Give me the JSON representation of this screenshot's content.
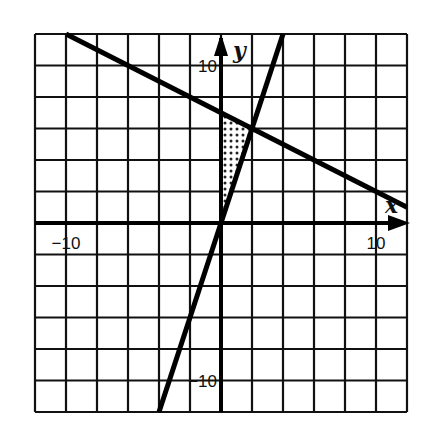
{
  "chart_data": {
    "type": "line",
    "title": "",
    "xlabel": "x",
    "ylabel": "y",
    "xlim": [
      -12,
      12
    ],
    "ylim": [
      -12,
      12
    ],
    "grid": true,
    "grid_step": 2,
    "x_tick_labels": [
      {
        "value": -10,
        "label": "−10"
      },
      {
        "value": 10,
        "label": "10"
      }
    ],
    "y_tick_labels": [
      {
        "value": 10,
        "label": "10"
      },
      {
        "value": -10,
        "label": "−10"
      }
    ],
    "series": [
      {
        "name": "y = 3x",
        "equation": "y = 3x",
        "points": [
          [
            -4,
            -12
          ],
          [
            4,
            12
          ]
        ]
      },
      {
        "name": "y = -0.5x + 7",
        "equation": "y = -x/2 + 7",
        "points": [
          [
            -10,
            12
          ],
          [
            12,
            1
          ]
        ]
      }
    ],
    "shaded_region": {
      "vertices": [
        [
          0,
          0
        ],
        [
          0,
          7
        ],
        [
          2,
          6
        ]
      ],
      "pattern": "dotted"
    },
    "intersection": [
      2,
      6
    ],
    "colors": {
      "grid": "#111111",
      "lines": "#000000",
      "background": "#ffffff"
    }
  }
}
